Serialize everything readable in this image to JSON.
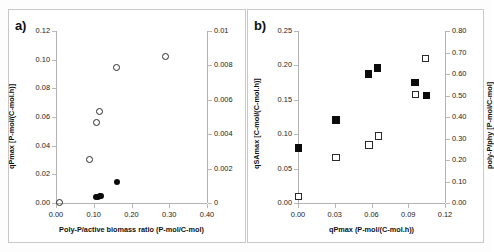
{
  "figure": {
    "background": "#fdfdfd",
    "panels": [
      "a",
      "b"
    ]
  },
  "panel_a": {
    "label": "a)",
    "chart_data": {
      "type": "scatter",
      "title": "",
      "xlabel": "Poly-P/active biomass ratio (P-mol/C-mol)",
      "ylabel": "qPmax [P-mol/(C-mol.h)]",
      "y2label": "mATP (mol ATP/[(C-mol.h)]",
      "xlim": [
        0.0,
        0.4
      ],
      "ylim": [
        0.0,
        0.12
      ],
      "y2lim": [
        0.0,
        0.01
      ],
      "xticks": [
        "0.00",
        "0.10",
        "0.20",
        "0.30",
        "0.40"
      ],
      "xtickvalues": [
        0.0,
        0.1,
        0.2,
        0.3,
        0.4
      ],
      "yticks": [
        "0.00",
        "0.02",
        "0.04",
        "0.06",
        "0.08",
        "0.10",
        "0.12"
      ],
      "ytickvalues": [
        0.0,
        0.02,
        0.04,
        0.06,
        0.08,
        0.1,
        0.12
      ],
      "y2ticks": [
        "0",
        "0.002",
        "0.004",
        "0.006",
        "0.008",
        "0.01"
      ],
      "y2tickvalues": [
        0.0,
        0.002,
        0.004,
        0.006,
        0.008,
        0.01
      ],
      "grid": false,
      "legend": "none",
      "series": [
        {
          "name": "qPmax",
          "marker": "open-circle",
          "axis": "left",
          "points": [
            {
              "x": 0.01,
              "y": 0.0005
            },
            {
              "x": 0.088,
              "y": 0.0305
            },
            {
              "x": 0.107,
              "y": 0.056
            },
            {
              "x": 0.114,
              "y": 0.0638
            },
            {
              "x": 0.161,
              "y": 0.0948
            },
            {
              "x": 0.289,
              "y": 0.1025
            }
          ]
        },
        {
          "name": "mATP",
          "marker": "filled-circle",
          "axis": "right",
          "points": [
            {
              "x": 0.107,
              "y": 0.00034
            },
            {
              "x": 0.112,
              "y": 0.00036
            },
            {
              "x": 0.116,
              "y": 0.0004
            },
            {
              "x": 0.119,
              "y": 0.00043
            },
            {
              "x": 0.161,
              "y": 0.00124
            }
          ]
        }
      ]
    }
  },
  "panel_b": {
    "label": "b)",
    "chart_data": {
      "type": "scatter",
      "title": "",
      "xlabel": "qPmax (P-mol/(C-mol.h))",
      "ylabel": "qSAmax [C-mol/(C-mol.h)]",
      "y2label": "poly-P/phy [P-mol/C-mol]",
      "xlim": [
        0.0,
        0.12
      ],
      "ylim": [
        0.0,
        0.25
      ],
      "y2lim": [
        0.0,
        0.8
      ],
      "xticks": [
        "0.00",
        "0.03",
        "0.06",
        "0.09",
        "0.12"
      ],
      "xtickvalues": [
        0.0,
        0.03,
        0.06,
        0.09,
        0.12
      ],
      "yticks": [
        "0.00",
        "0.05",
        "0.10",
        "0.15",
        "0.20",
        "0.25"
      ],
      "ytickvalues": [
        0.0,
        0.05,
        0.1,
        0.15,
        0.2,
        0.25
      ],
      "y2ticks": [
        "0.00",
        "0.10",
        "0.20",
        "0.30",
        "0.40",
        "0.50",
        "0.60",
        "0.70",
        "0.80"
      ],
      "y2tickvalues": [
        0.0,
        0.1,
        0.2,
        0.3,
        0.4,
        0.5,
        0.6,
        0.7,
        0.8
      ],
      "grid": false,
      "legend": "none",
      "series": [
        {
          "name": "qSAmax",
          "marker": "filled-square",
          "axis": "left",
          "points": [
            {
              "x": 0.0005,
              "y": 0.08
            },
            {
              "x": 0.031,
              "y": 0.1205
            },
            {
              "x": 0.0575,
              "y": 0.1875
            },
            {
              "x": 0.065,
              "y": 0.1965
            },
            {
              "x": 0.0955,
              "y": 0.1755
            },
            {
              "x": 0.105,
              "y": 0.1565
            }
          ]
        },
        {
          "name": "poly-P/phy",
          "marker": "open-square",
          "axis": "right",
          "points": [
            {
              "x": 0.0005,
              "y": 0.03
            },
            {
              "x": 0.031,
              "y": 0.212
            },
            {
              "x": 0.058,
              "y": 0.27
            },
            {
              "x": 0.0655,
              "y": 0.312
            },
            {
              "x": 0.096,
              "y": 0.505
            },
            {
              "x": 0.104,
              "y": 0.672
            }
          ]
        }
      ]
    }
  }
}
